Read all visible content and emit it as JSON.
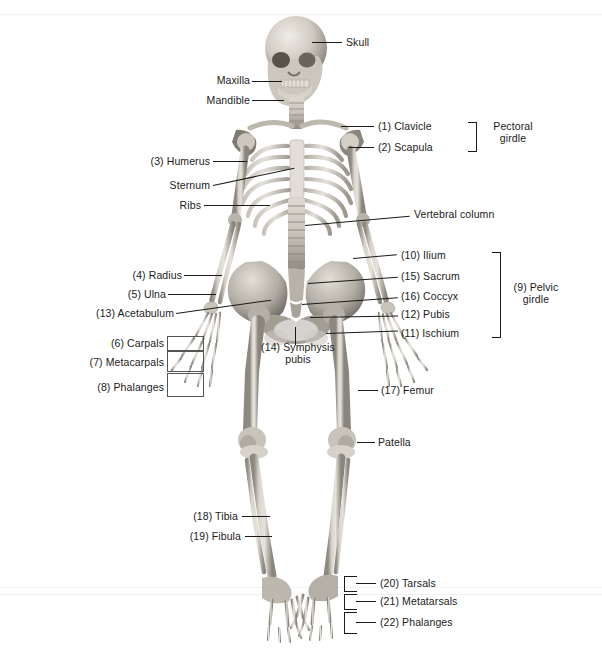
{
  "figure": {
    "caption": "",
    "background_color": "#ffffff",
    "label_color": "#1a1a1a",
    "bone_tone_light": "#dedad2",
    "bone_tone_mid": "#a9a49b",
    "bone_tone_dark": "#6f6a63"
  },
  "labels": {
    "skull": "Skull",
    "maxilla": "Maxilla",
    "mandible": "Mandible",
    "clavicle": "(1) Clavicle",
    "scapula": "(2) Scapula",
    "humerus": "(3) Humerus",
    "sternum": "Sternum",
    "ribs": "Ribs",
    "vertebral_column": "Vertebral column",
    "ilium": "(10) Ilium",
    "sacrum": "(15) Sacrum",
    "coccyx": "(16) Coccyx",
    "pubis": "(12) Pubis",
    "ischium": "(11) Ischium",
    "radius": "(4) Radius",
    "ulna": "(5) Ulna",
    "acetabulum": "(13) Acetabulum",
    "carpals": "(6) Carpals",
    "metacarpals": "(7) Metacarpals",
    "phalanges_hand": "(8) Phalanges",
    "symphysis_pubis_line1": "(14) Symphysis",
    "symphysis_pubis_line2": "pubis",
    "femur": "(17) Femur",
    "patella": "Patella",
    "tibia": "(18) Tibia",
    "fibula": "(19) Fibula",
    "tarsals": "(20) Tarsals",
    "metatarsals": "(21) Metatarsals",
    "phalanges_foot": "(22) Phalanges"
  },
  "groups": {
    "pectoral_line1": "Pectoral",
    "pectoral_line2": "girdle",
    "pelvic_line1": "(9) Pelvic",
    "pelvic_line2": "girdle"
  },
  "numbered_index": [
    {
      "n": 1,
      "name": "Clavicle"
    },
    {
      "n": 2,
      "name": "Scapula"
    },
    {
      "n": 3,
      "name": "Humerus"
    },
    {
      "n": 4,
      "name": "Radius"
    },
    {
      "n": 5,
      "name": "Ulna"
    },
    {
      "n": 6,
      "name": "Carpals"
    },
    {
      "n": 7,
      "name": "Metacarpals"
    },
    {
      "n": 8,
      "name": "Phalanges"
    },
    {
      "n": 9,
      "name": "Pelvic girdle"
    },
    {
      "n": 10,
      "name": "Ilium"
    },
    {
      "n": 11,
      "name": "Ischium"
    },
    {
      "n": 12,
      "name": "Pubis"
    },
    {
      "n": 13,
      "name": "Acetabulum"
    },
    {
      "n": 14,
      "name": "Symphysis pubis"
    },
    {
      "n": 15,
      "name": "Sacrum"
    },
    {
      "n": 16,
      "name": "Coccyx"
    },
    {
      "n": 17,
      "name": "Femur"
    },
    {
      "n": 18,
      "name": "Tibia"
    },
    {
      "n": 19,
      "name": "Fibula"
    },
    {
      "n": 20,
      "name": "Tarsals"
    },
    {
      "n": 21,
      "name": "Metatarsals"
    },
    {
      "n": 22,
      "name": "Phalanges"
    }
  ],
  "unnumbered_index": [
    {
      "name": "Skull"
    },
    {
      "name": "Maxilla"
    },
    {
      "name": "Mandible"
    },
    {
      "name": "Sternum"
    },
    {
      "name": "Ribs"
    },
    {
      "name": "Vertebral column"
    },
    {
      "name": "Patella"
    },
    {
      "name": "Pectoral girdle"
    }
  ]
}
